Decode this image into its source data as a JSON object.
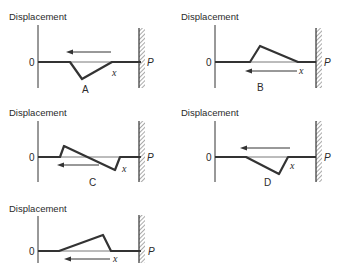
{
  "figure": {
    "y_axis_label": "Displacement",
    "zero_label": "0",
    "position_label": "x",
    "wall_label": "P",
    "colors": {
      "line": "#333333",
      "background": "#ffffff"
    },
    "panels": [
      {
        "id": "A",
        "caption": "A",
        "pulse": "inverted triangular pulse, steep leading edge on left",
        "arrow_direction": "left",
        "arrow_position": "above"
      },
      {
        "id": "B",
        "caption": "B",
        "pulse": "upright triangular pulse, steep leading edge on left",
        "arrow_direction": "left",
        "arrow_position": "below"
      },
      {
        "id": "C",
        "caption": "C",
        "pulse": "upright peak on left, inverted peak on right (reflecting)",
        "arrow_direction": "left",
        "arrow_position": "below"
      },
      {
        "id": "D",
        "caption": "D",
        "pulse": "inverted triangular pulse, steep edge on right",
        "arrow_direction": "left",
        "arrow_position": "above"
      },
      {
        "id": "E",
        "caption": "",
        "pulse": "upright triangular pulse, steep edge on right",
        "arrow_direction": "left",
        "arrow_position": "below"
      }
    ]
  }
}
